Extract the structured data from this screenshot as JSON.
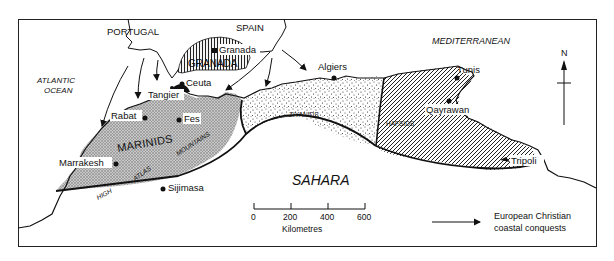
{
  "map": {
    "title": "Maghreb c. 1400: Marinids, Ziyanids, Hafsids and European Christian coastal conquests",
    "countries": {
      "portugal": "PORTUGAL",
      "spain": "SPAIN"
    },
    "seas": {
      "atlantic_line1": "ATLANTIC",
      "atlantic_line2": "OCEAN",
      "mediterranean": "MEDITERRANEAN",
      "sahara": "SAHARA"
    },
    "regions": {
      "granada": "GRANADA",
      "marinids": "MARINIDS",
      "ziyanids": "ZIYANIDS",
      "hafsids": "HAFSIDS"
    },
    "mountains": {
      "high": "HIGH",
      "atlas": "ATLAS",
      "mountains": "MOUNTAINS"
    },
    "cities": [
      {
        "name": "Granada"
      },
      {
        "name": "Ceuta"
      },
      {
        "name": "Tangier"
      },
      {
        "name": "Rabat"
      },
      {
        "name": "Fes"
      },
      {
        "name": "Marrakesh"
      },
      {
        "name": "Sijimasa"
      },
      {
        "name": "Algiers"
      },
      {
        "name": "Tunis"
      },
      {
        "name": "Qayrawan"
      },
      {
        "name": "Tripoli"
      }
    ],
    "north_label": "N",
    "scale": {
      "ticks": [
        "0",
        "200",
        "400",
        "600"
      ],
      "unit": "Kilometres"
    },
    "legend": {
      "line1": "European Christian",
      "line2": "coastal conquests",
      "icon": "arrow-right-icon"
    },
    "patterns": {
      "granada": "vertical-hatch",
      "marinids": "cross-hatch-grey",
      "ziyanids": "stipple",
      "hafsids": "diagonal-hatch"
    },
    "colors": {
      "ink": "#111111",
      "paper": "#ffffff",
      "marinid_fill": "#bdbdbd"
    }
  }
}
